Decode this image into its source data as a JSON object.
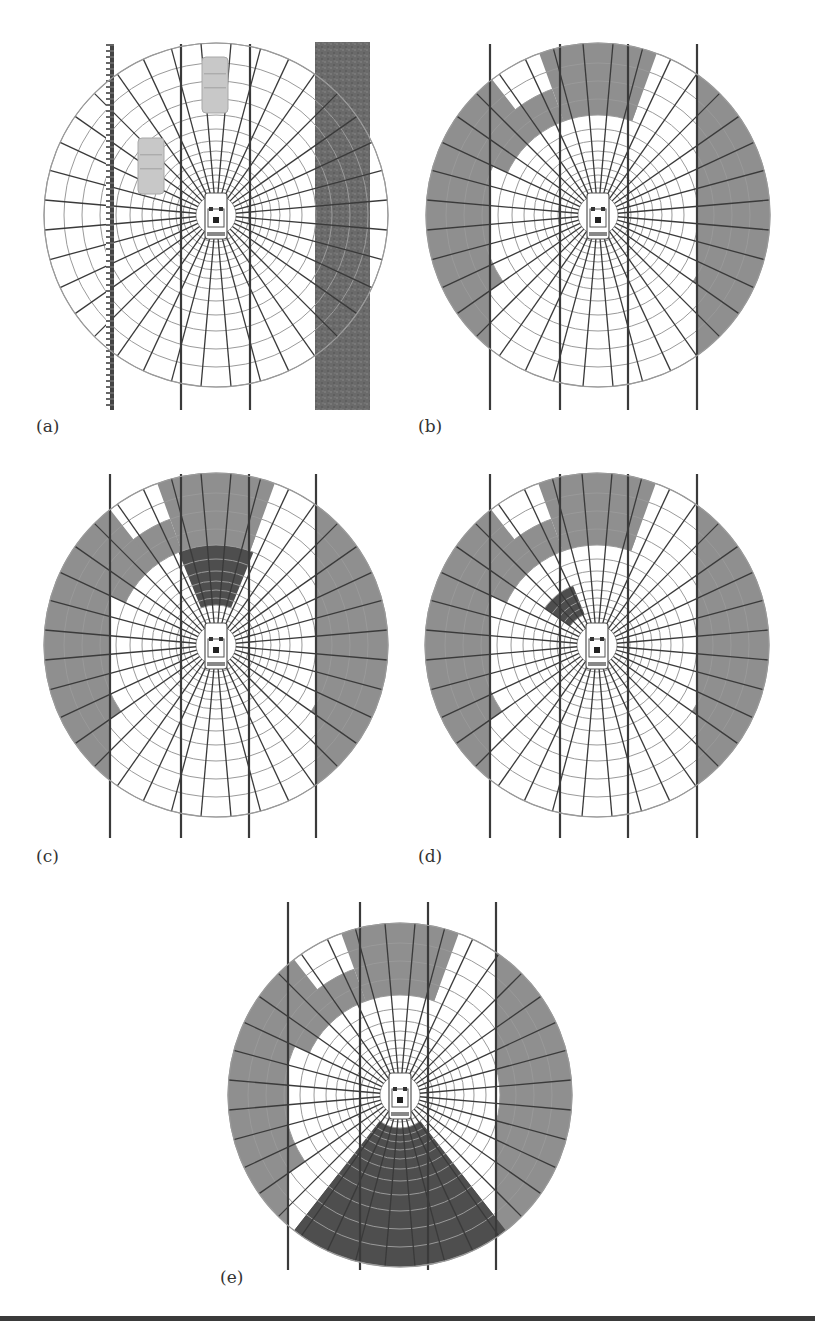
{
  "figure": {
    "width": 815,
    "height": 1336,
    "colors": {
      "background": "#ffffff",
      "grid_ring": "#9a9a9a",
      "grid_spoke": "#3a3a3a",
      "lane_line": "#3a3a3a",
      "occupied_gray": "#8f8f8f",
      "highlight_dark": "#4e4e4e",
      "rough_strip": "#6a6a6a",
      "parked_car": "#c8c8c8",
      "bottom_rule": "#3a3a3a"
    },
    "grid": {
      "radius": 172,
      "spokes": 36,
      "rings": [
        20,
        27,
        33,
        40,
        47,
        55,
        64,
        74,
        86,
        100,
        116,
        134,
        152,
        172
      ]
    },
    "bottom_rule_y": 1316
  },
  "panels": [
    {
      "id": "a",
      "label": "(a)",
      "label_pos": [
        36,
        432
      ],
      "center": [
        216,
        215
      ],
      "lanes": [
        181,
        250
      ],
      "lane_top": 44,
      "lane_bottom": 410,
      "guardrail": {
        "x": 110,
        "top": 44,
        "bottom": 410
      },
      "rough_strip": {
        "x": 315,
        "width": 55,
        "top": 42,
        "bottom": 410
      },
      "parked_cars": [
        {
          "x": 202,
          "y": 57,
          "w": 26,
          "h": 56
        },
        {
          "x": 138,
          "y": 138,
          "w": 26,
          "h": 56
        }
      ],
      "shaded": []
    },
    {
      "id": "b",
      "label": "(b)",
      "label_pos": [
        418,
        432
      ],
      "center": [
        598,
        215
      ],
      "lanes": [
        490,
        560,
        628,
        697
      ],
      "lane_top": 44,
      "lane_bottom": 410,
      "shaded": [
        {
          "tone": "gray",
          "a0": 200,
          "a1": 340,
          "r0": 152,
          "r1": 172,
          "mode": "band"
        },
        {
          "tone": "gray",
          "a0": 70,
          "a1": 110,
          "r0": 100,
          "r1": 172,
          "mode": "sector"
        },
        {
          "tone": "gray",
          "a0": 150,
          "a1": 215,
          "r0": 116,
          "r1": 172,
          "mode": "sector"
        },
        {
          "tone": "gray",
          "a0": 325,
          "a1": 390,
          "r0": 116,
          "r1": 172,
          "mode": "sector"
        },
        {
          "tone": "gray",
          "a0": 110,
          "a1": 155,
          "r0": 64,
          "r1": 134,
          "mode": "sector"
        },
        {
          "tone": "gray",
          "a0": 128,
          "a1": 148,
          "r0": 86,
          "r1": 172,
          "mode": "sector"
        }
      ]
    },
    {
      "id": "c",
      "label": "(c)",
      "label_pos": [
        36,
        862
      ],
      "center": [
        216,
        645
      ],
      "lanes": [
        110,
        181,
        249,
        316
      ],
      "lane_top": 474,
      "lane_bottom": 838,
      "shaded": [
        {
          "tone": "gray",
          "a0": 200,
          "a1": 340,
          "r0": 152,
          "r1": 172,
          "mode": "band"
        },
        {
          "tone": "gray",
          "a0": 70,
          "a1": 110,
          "r0": 100,
          "r1": 172,
          "mode": "sector"
        },
        {
          "tone": "gray",
          "a0": 150,
          "a1": 215,
          "r0": 116,
          "r1": 172,
          "mode": "sector"
        },
        {
          "tone": "gray",
          "a0": 325,
          "a1": 390,
          "r0": 116,
          "r1": 172,
          "mode": "sector"
        },
        {
          "tone": "gray",
          "a0": 110,
          "a1": 155,
          "r0": 64,
          "r1": 134,
          "mode": "sector"
        },
        {
          "tone": "gray",
          "a0": 128,
          "a1": 148,
          "r0": 86,
          "r1": 172,
          "mode": "sector"
        },
        {
          "tone": "dark",
          "a0": 68,
          "a1": 112,
          "r0": 40,
          "r1": 100,
          "mode": "sector"
        }
      ]
    },
    {
      "id": "d",
      "label": "(d)",
      "label_pos": [
        418,
        862
      ],
      "center": [
        597,
        645
      ],
      "lanes": [
        490,
        560,
        628,
        697
      ],
      "lane_top": 474,
      "lane_bottom": 838,
      "shaded": [
        {
          "tone": "gray",
          "a0": 200,
          "a1": 340,
          "r0": 152,
          "r1": 172,
          "mode": "band"
        },
        {
          "tone": "gray",
          "a0": 70,
          "a1": 110,
          "r0": 100,
          "r1": 172,
          "mode": "sector"
        },
        {
          "tone": "gray",
          "a0": 150,
          "a1": 215,
          "r0": 116,
          "r1": 172,
          "mode": "sector"
        },
        {
          "tone": "gray",
          "a0": 325,
          "a1": 390,
          "r0": 116,
          "r1": 172,
          "mode": "sector"
        },
        {
          "tone": "gray",
          "a0": 110,
          "a1": 155,
          "r0": 64,
          "r1": 134,
          "mode": "sector"
        },
        {
          "tone": "gray",
          "a0": 128,
          "a1": 148,
          "r0": 86,
          "r1": 172,
          "mode": "sector"
        },
        {
          "tone": "dark",
          "a0": 112,
          "a1": 145,
          "r0": 33,
          "r1": 64,
          "mode": "sector"
        }
      ]
    },
    {
      "id": "e",
      "label": "(e)",
      "label_pos": [
        220,
        1283
      ],
      "center": [
        400,
        1095
      ],
      "lanes": [
        288,
        360,
        428,
        496
      ],
      "lane_top": 902,
      "lane_bottom": 1270,
      "shaded": [
        {
          "tone": "gray",
          "a0": 200,
          "a1": 340,
          "r0": 152,
          "r1": 172,
          "mode": "band"
        },
        {
          "tone": "gray",
          "a0": 70,
          "a1": 110,
          "r0": 100,
          "r1": 172,
          "mode": "sector"
        },
        {
          "tone": "gray",
          "a0": 150,
          "a1": 215,
          "r0": 116,
          "r1": 172,
          "mode": "sector"
        },
        {
          "tone": "gray",
          "a0": 325,
          "a1": 390,
          "r0": 116,
          "r1": 172,
          "mode": "sector"
        },
        {
          "tone": "gray",
          "a0": 110,
          "a1": 155,
          "r0": 64,
          "r1": 134,
          "mode": "sector"
        },
        {
          "tone": "gray",
          "a0": 128,
          "a1": 148,
          "r0": 86,
          "r1": 172,
          "mode": "sector"
        },
        {
          "tone": "dark",
          "a0": 232,
          "a1": 308,
          "r0": 33,
          "r1": 172,
          "mode": "sector"
        }
      ]
    }
  ]
}
